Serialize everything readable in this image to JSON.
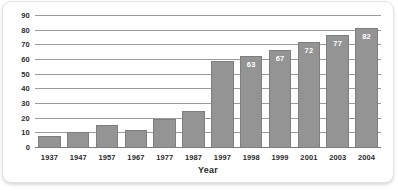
{
  "chart_data": {
    "type": "bar",
    "title": "",
    "subtitle": "",
    "xlabel": "Year",
    "ylabel": "",
    "categories": [
      "1937",
      "1947",
      "1957",
      "1967",
      "1977",
      "1987",
      "1997",
      "1998",
      "1999",
      "2001",
      "2003",
      "2004"
    ],
    "values": [
      8,
      11,
      16,
      12,
      20,
      25,
      59,
      63,
      67,
      72,
      77,
      82
    ],
    "data_labels": [
      "",
      "",
      "",
      "",
      "",
      "",
      "",
      "63",
      "67",
      "72",
      "77",
      "82"
    ],
    "ylim": [
      0,
      90
    ],
    "ytick_labels": [
      "0",
      "10",
      "20",
      "30",
      "40",
      "50",
      "60",
      "70",
      "80",
      "90"
    ],
    "ytick_values": [
      0,
      10,
      20,
      30,
      40,
      50,
      60,
      70,
      80,
      90
    ],
    "grid": true,
    "legend": null,
    "legend_position": "none",
    "colors": {
      "bar_fill": "#949494",
      "bar_stroke": "#7e7e7e",
      "gridline": "#9a9a9a",
      "axis": "#7d7d7d",
      "tick_text": "#2b2b2b",
      "data_label_text": "#ffffff",
      "frame_border": "#e2e2e2",
      "background": "#ffffff"
    }
  }
}
